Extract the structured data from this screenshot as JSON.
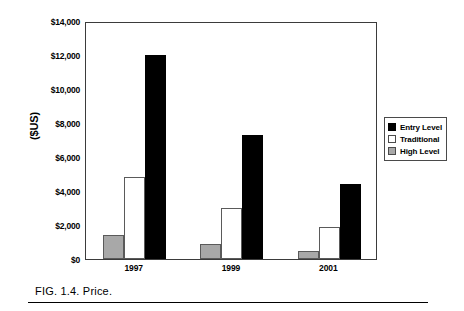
{
  "figure": {
    "caption": "FIG. 1.4.   Price."
  },
  "chart_data": {
    "type": "bar",
    "title": "",
    "xlabel": "",
    "ylabel": "($US)",
    "categories": [
      "1997",
      "1999",
      "2001"
    ],
    "series": [
      {
        "name": "Entry Level",
        "color": "#000000",
        "values": [
          12000,
          7300,
          4400
        ]
      },
      {
        "name": "Traditional",
        "color": "#ffffff",
        "values": [
          4800,
          3000,
          1900
        ]
      },
      {
        "name": "High Level",
        "color": "#a8a8a8",
        "values": [
          1400,
          900,
          500
        ]
      }
    ],
    "bar_order": [
      "High Level",
      "Traditional",
      "Entry Level"
    ],
    "ylim": [
      0,
      14000
    ],
    "ytick_labels": [
      "$0",
      "$2,000",
      "$4,000",
      "$6,000",
      "$8,000",
      "$10,000",
      "$12,000",
      "$14,000"
    ],
    "ytick_values": [
      0,
      2000,
      4000,
      6000,
      8000,
      10000,
      12000,
      14000
    ],
    "grid": false,
    "legend_position": "right-outside",
    "legend": [
      {
        "label": "Entry Level",
        "swatch": "black-square"
      },
      {
        "label": "Traditional",
        "swatch": "white-square"
      },
      {
        "label": "High Level",
        "swatch": "gray-square"
      }
    ]
  }
}
